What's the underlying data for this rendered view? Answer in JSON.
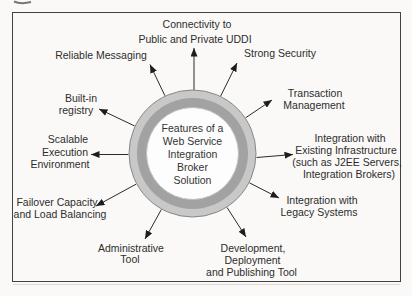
{
  "diagram": {
    "center": {
      "line1": "Features of a",
      "line2": "Web Service",
      "line3": "Integration",
      "line4": "Broker",
      "line5": "Solution"
    },
    "labels": {
      "uddi": {
        "line1": "Connectivity to",
        "line2": "Public and Private UDDI"
      },
      "reliable": {
        "line1": "Reliable Messaging"
      },
      "security": {
        "line1": "Strong Security"
      },
      "registry": {
        "line1": "Built-in",
        "line2": "registry"
      },
      "transaction": {
        "line1": "Transaction",
        "line2": "Management"
      },
      "scalable": {
        "line1": "Scalable",
        "line2": "Execution",
        "line3": "Environment"
      },
      "infrastructure": {
        "line1": "Integration with",
        "line2": "Existing Infrastructure",
        "line3": "(such as J2EE Servers,",
        "line4": "Integration Brokers)"
      },
      "failover": {
        "line1": "Failover Capacity",
        "line2": "and Load Balancing"
      },
      "legacy": {
        "line1": "Integration with",
        "line2": "Legacy Systems"
      },
      "admin": {
        "line1": "Administrative",
        "line2": "Tool"
      },
      "devtool": {
        "line1": "Development,",
        "line2": "Deployment",
        "line3": "and Publishing Tool"
      }
    },
    "colors": {
      "ring_outer": "#c8c8c8",
      "ring_mid": "#a2a2a2",
      "hub_fill": "#fdfdfd",
      "border": "#424242",
      "ink": "#2d2d2d",
      "background": "#faf9f7"
    }
  }
}
